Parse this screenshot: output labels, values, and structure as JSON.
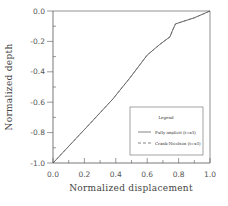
{
  "chart_data": {
    "type": "line",
    "title": "",
    "xlabel": "Normalized displacement",
    "ylabel": "Normalized depth",
    "xlim": [
      0.0,
      1.0
    ],
    "ylim": [
      -1.0,
      0.0
    ],
    "xticks": [
      "0.0",
      "0.2",
      "0.4",
      "0.6",
      "0.8",
      "1.0"
    ],
    "yticks": [
      "0.0",
      "-0.2",
      "-0.4",
      "-0.6",
      "-0.8",
      "-1.0"
    ],
    "grid": false,
    "legend_position": "lower right",
    "legend_title": "Legend",
    "series": [
      {
        "name": "Fully implicit (t=x3)",
        "style": "solid",
        "x": [
          0.0,
          0.2,
          0.38,
          0.49,
          0.6,
          0.68,
          0.745,
          0.76,
          0.78,
          0.9,
          1.0
        ],
        "y": [
          -1.0,
          -0.78,
          -0.58,
          -0.44,
          -0.29,
          -0.22,
          -0.17,
          -0.13,
          -0.085,
          -0.045,
          0.0
        ]
      },
      {
        "name": "Crank-Nicolson (t=x3)",
        "style": "dashed",
        "x": [
          0.0,
          0.2,
          0.38,
          0.49,
          0.6,
          0.68,
          0.745,
          0.765,
          0.78,
          0.9,
          1.0
        ],
        "y": [
          -1.0,
          -0.78,
          -0.58,
          -0.44,
          -0.29,
          -0.22,
          -0.17,
          -0.12,
          -0.085,
          -0.045,
          0.0
        ]
      }
    ]
  }
}
